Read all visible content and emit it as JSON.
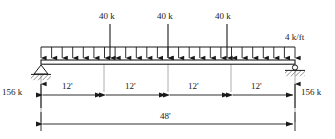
{
  "figure": {
    "name": "simply-supported-beam-free-body-diagram",
    "beam": {
      "left_x": 41,
      "right_x": 295,
      "length_label": "48'"
    },
    "colors": {
      "ink": "#1a1a1a",
      "guide": "#9a9a9a",
      "background": "#ffffff"
    }
  },
  "point_loads": [
    {
      "label": "40 k",
      "x": 110
    },
    {
      "label": "40 k",
      "x": 168
    },
    {
      "label": "40 k",
      "x": 227
    }
  ],
  "distributed_load": {
    "label": "4 k/ft",
    "arrow_count": 25
  },
  "supports": [
    {
      "type": "pin",
      "x": 41
    },
    {
      "type": "roller",
      "x": 295
    }
  ],
  "reactions": [
    {
      "label": "156 k",
      "x": 41,
      "direction": "up"
    },
    {
      "label": "156 k",
      "x": 295,
      "direction": "up"
    }
  ],
  "dimensions": {
    "segments": [
      {
        "label": "12'",
        "from": 41,
        "to": 104
      },
      {
        "label": "12'",
        "from": 104,
        "to": 168
      },
      {
        "label": "12'",
        "from": 168,
        "to": 231
      },
      {
        "label": "12'",
        "from": 231,
        "to": 295
      }
    ],
    "total": {
      "label": "48'",
      "from": 41,
      "to": 295
    }
  }
}
